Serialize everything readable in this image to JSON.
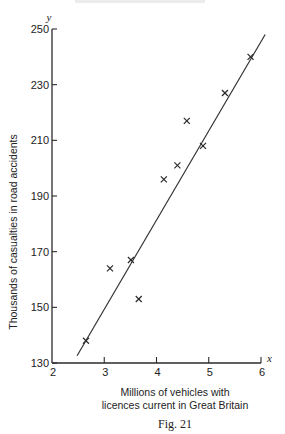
{
  "figure": {
    "caption": "Fig. 21",
    "xlabel_line1": "Millions of vehicles with",
    "xlabel_line2": "licences current in Great Britain",
    "ylabel": "Thousands of casualties in road accidents",
    "x_var": "x",
    "y_var": "y"
  },
  "chart_data": {
    "type": "scatter",
    "title": "",
    "caption": "Fig. 21",
    "xlabel": "Millions of vehicles with licences current in Great Britain",
    "ylabel": "Thousands of casualties in road accidents",
    "xlim": [
      2,
      6
    ],
    "ylim": [
      130,
      250
    ],
    "x_ticks": [
      2,
      3,
      4,
      5,
      6
    ],
    "y_ticks": [
      130,
      150,
      170,
      190,
      210,
      230,
      250
    ],
    "grid": false,
    "legend": null,
    "marker": "x",
    "points": [
      {
        "x": 2.65,
        "y": 138
      },
      {
        "x": 3.11,
        "y": 164
      },
      {
        "x": 3.51,
        "y": 167
      },
      {
        "x": 3.66,
        "y": 153
      },
      {
        "x": 4.14,
        "y": 196
      },
      {
        "x": 4.4,
        "y": 201
      },
      {
        "x": 4.58,
        "y": 217
      },
      {
        "x": 4.89,
        "y": 208
      },
      {
        "x": 5.31,
        "y": 227
      },
      {
        "x": 5.8,
        "y": 240
      }
    ],
    "fit_line": {
      "type": "linear",
      "from": {
        "x": 2.48,
        "y": 132.6
      },
      "to": {
        "x": 6.08,
        "y": 248.0
      }
    }
  }
}
